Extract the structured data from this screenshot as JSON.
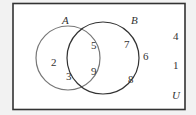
{
  "diagram": {
    "type": "venn",
    "universe_label": "U",
    "sets": [
      {
        "name": "A",
        "only_elements": [
          "2",
          "3"
        ]
      },
      {
        "name": "B",
        "only_elements": [
          "7",
          "6",
          "8"
        ]
      }
    ],
    "intersection": [
      "5",
      "9"
    ],
    "outside": [
      "4",
      "1"
    ],
    "labels": {
      "A": "A",
      "B": "B",
      "U": "U",
      "a_only": [
        "2",
        "3"
      ],
      "ab": [
        "5",
        "9"
      ],
      "b_only": [
        "7",
        "6",
        "8"
      ],
      "outside": [
        "4",
        "1"
      ]
    },
    "colors": {
      "background": "#f2f2f2",
      "panel": "#ffffff",
      "border": "#333333",
      "circle_a": "#777777",
      "circle_b": "#333333"
    }
  }
}
